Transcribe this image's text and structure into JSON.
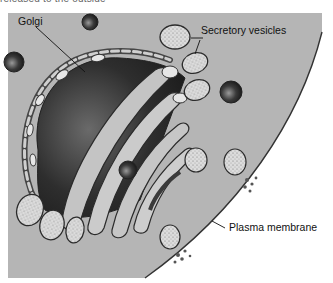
{
  "figure": {
    "caption_fragment": "released to the outside",
    "labels": {
      "golgi": "Golgi",
      "secretory_vesicles": "Secretory vesicles",
      "plasma_membrane": "Plasma membrane"
    },
    "colors": {
      "cytoplasm": "#b5b5b5",
      "golgi_dark": "#3a3a3a",
      "cisterna_fill": "#c9c9c9",
      "vesicle_fill": "#dedede",
      "membrane": "#333333",
      "background": "#ffffff"
    }
  }
}
